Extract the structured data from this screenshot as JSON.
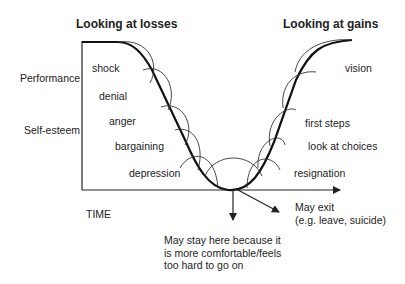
{
  "headers": {
    "losses": "Looking at losses",
    "gains": "Looking at gains"
  },
  "axes": {
    "y_labels": [
      "Performance",
      "Self-esteem"
    ],
    "x_label": "TIME"
  },
  "loss_stages": [
    "shock",
    "denial",
    "anger",
    "bargaining",
    "depression"
  ],
  "gain_stages": [
    "vision",
    "first steps",
    "look at choices",
    "resignation"
  ],
  "outcomes": {
    "exit": [
      "May exit",
      "(e.g. leave, suicide)"
    ],
    "stay": [
      "May stay here because it",
      "is more comfortable/feels",
      "too hard to go on"
    ]
  }
}
